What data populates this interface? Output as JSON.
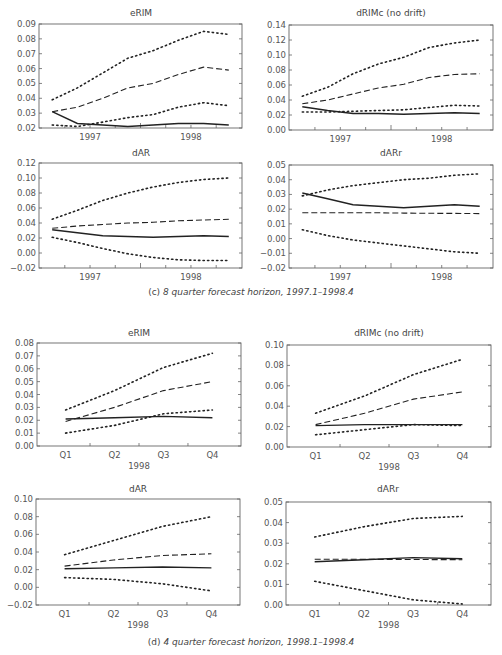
{
  "figure": {
    "caption_c": {
      "label": "(c)",
      "text": "8 quarter forecast horizon, 1997.1–1998.4"
    },
    "caption_d": {
      "label": "(d)",
      "text": "4 quarter forecast horizon, 1998.1–1998.4"
    }
  },
  "chart_data": [
    {
      "id": "c-eRIM",
      "panel": "c",
      "type": "line",
      "title": "eRIM",
      "x": [
        1,
        2,
        3,
        4,
        5,
        6,
        7,
        8
      ],
      "xticks": [
        {
          "pos": 2.5,
          "label": "1997"
        },
        {
          "pos": 6.5,
          "label": "1998"
        }
      ],
      "xlabel": "",
      "ylabel": "",
      "ylim": [
        0.02,
        0.09
      ],
      "yticks": [
        "0.02",
        "0.03",
        "0.04",
        "0.05",
        "0.06",
        "0.07",
        "0.08",
        "0.09"
      ],
      "series": [
        {
          "name": "actual",
          "style": "solid",
          "values": [
            0.031,
            0.023,
            0.022,
            0.021,
            0.022,
            0.023,
            0.023,
            0.022
          ]
        },
        {
          "name": "forecast",
          "style": "dashed",
          "values": [
            0.031,
            0.034,
            0.04,
            0.047,
            0.05,
            0.056,
            0.061,
            0.059
          ]
        },
        {
          "name": "upper band",
          "style": "dotted",
          "values": [
            0.039,
            0.047,
            0.057,
            0.067,
            0.072,
            0.079,
            0.085,
            0.083
          ]
        },
        {
          "name": "lower band",
          "style": "dotted",
          "values": [
            0.022,
            0.021,
            0.024,
            0.027,
            0.029,
            0.034,
            0.037,
            0.035
          ]
        }
      ]
    },
    {
      "id": "c-dRIMc",
      "panel": "c",
      "type": "line",
      "title": "dRIMc (no drift)",
      "x": [
        1,
        2,
        3,
        4,
        5,
        6,
        7,
        8
      ],
      "xticks": [
        {
          "pos": 2.5,
          "label": "1997"
        },
        {
          "pos": 6.5,
          "label": "1998"
        }
      ],
      "xlabel": "",
      "ylabel": "",
      "ylim": [
        0.0,
        0.14
      ],
      "yticks": [
        "0.00",
        "0.02",
        "0.04",
        "0.06",
        "0.08",
        "0.10",
        "0.12",
        "0.14"
      ],
      "series": [
        {
          "name": "actual",
          "style": "solid",
          "values": [
            0.031,
            0.026,
            0.022,
            0.022,
            0.021,
            0.022,
            0.023,
            0.022
          ]
        },
        {
          "name": "forecast",
          "style": "dashed",
          "values": [
            0.035,
            0.04,
            0.048,
            0.056,
            0.061,
            0.07,
            0.074,
            0.075
          ]
        },
        {
          "name": "upper band",
          "style": "dotted",
          "values": [
            0.045,
            0.057,
            0.075,
            0.088,
            0.097,
            0.11,
            0.116,
            0.12
          ]
        },
        {
          "name": "lower band",
          "style": "dotted",
          "values": [
            0.024,
            0.024,
            0.025,
            0.026,
            0.027,
            0.03,
            0.033,
            0.032
          ]
        }
      ]
    },
    {
      "id": "c-dAR",
      "panel": "c",
      "type": "line",
      "title": "dAR",
      "x": [
        1,
        2,
        3,
        4,
        5,
        6,
        7,
        8
      ],
      "xticks": [
        {
          "pos": 2.5,
          "label": "1997"
        },
        {
          "pos": 6.5,
          "label": "1998"
        }
      ],
      "xlabel": "",
      "ylabel": "",
      "ylim": [
        -0.02,
        0.12
      ],
      "yticks": [
        "−0.02",
        "0.00",
        "0.02",
        "0.04",
        "0.06",
        "0.08",
        "0.10",
        "0.12"
      ],
      "series": [
        {
          "name": "actual",
          "style": "solid",
          "values": [
            0.031,
            0.027,
            0.023,
            0.022,
            0.021,
            0.022,
            0.023,
            0.022
          ]
        },
        {
          "name": "forecast",
          "style": "dashed",
          "values": [
            0.033,
            0.036,
            0.038,
            0.04,
            0.041,
            0.043,
            0.044,
            0.045
          ]
        },
        {
          "name": "upper band",
          "style": "dotted",
          "values": [
            0.045,
            0.057,
            0.07,
            0.08,
            0.088,
            0.094,
            0.098,
            0.1
          ]
        },
        {
          "name": "lower band",
          "style": "dotted",
          "values": [
            0.021,
            0.014,
            0.006,
            -0.001,
            -0.006,
            -0.009,
            -0.01,
            -0.01
          ]
        }
      ]
    },
    {
      "id": "c-dARr",
      "panel": "c",
      "type": "line",
      "title": "dARr",
      "x": [
        1,
        2,
        3,
        4,
        5,
        6,
        7,
        8
      ],
      "xticks": [
        {
          "pos": 2.5,
          "label": "1997"
        },
        {
          "pos": 6.5,
          "label": "1998"
        }
      ],
      "xlabel": "",
      "ylabel": "",
      "ylim": [
        -0.02,
        0.05
      ],
      "yticks": [
        "−0.02",
        "−0.01",
        "0.00",
        "0.01",
        "0.02",
        "0.03",
        "0.04",
        "0.05"
      ],
      "series": [
        {
          "name": "actual",
          "style": "solid",
          "values": [
            0.031,
            0.027,
            0.023,
            0.022,
            0.021,
            0.022,
            0.023,
            0.022
          ]
        },
        {
          "name": "forecast",
          "style": "dashed",
          "values": [
            0.0175,
            0.0175,
            0.0175,
            0.0175,
            0.0173,
            0.0172,
            0.0171,
            0.017
          ]
        },
        {
          "name": "upper band",
          "style": "dotted",
          "values": [
            0.029,
            0.033,
            0.036,
            0.038,
            0.04,
            0.041,
            0.043,
            0.044
          ]
        },
        {
          "name": "lower band",
          "style": "dotted",
          "values": [
            0.006,
            0.002,
            -0.001,
            -0.003,
            -0.005,
            -0.007,
            -0.009,
            -0.01
          ]
        }
      ]
    },
    {
      "id": "d-eRIM",
      "panel": "d",
      "type": "line",
      "title": "eRIM",
      "categories": [
        "Q1",
        "Q2",
        "Q3",
        "Q4"
      ],
      "xlabel": "1998",
      "ylabel": "",
      "ylim": [
        0.0,
        0.08
      ],
      "yticks": [
        "0.00",
        "0.01",
        "0.02",
        "0.03",
        "0.04",
        "0.05",
        "0.06",
        "0.07",
        "0.08"
      ],
      "series": [
        {
          "name": "actual",
          "style": "solid",
          "values": [
            0.021,
            0.022,
            0.023,
            0.022
          ]
        },
        {
          "name": "forecast",
          "style": "dashed",
          "values": [
            0.019,
            0.03,
            0.043,
            0.05
          ]
        },
        {
          "name": "upper band",
          "style": "dotted",
          "values": [
            0.028,
            0.043,
            0.061,
            0.072
          ]
        },
        {
          "name": "lower band",
          "style": "dotted",
          "values": [
            0.01,
            0.016,
            0.025,
            0.028
          ]
        }
      ]
    },
    {
      "id": "d-dRIMc",
      "panel": "d",
      "type": "line",
      "title": "dRIMc (no drift)",
      "categories": [
        "Q1",
        "Q2",
        "Q3",
        "Q4"
      ],
      "xlabel": "1998",
      "ylabel": "",
      "ylim": [
        0.0,
        0.1
      ],
      "yticks": [
        "0.00",
        "0.02",
        "0.04",
        "0.06",
        "0.08",
        "0.10"
      ],
      "series": [
        {
          "name": "actual",
          "style": "solid",
          "values": [
            0.021,
            0.022,
            0.022,
            0.022
          ]
        },
        {
          "name": "forecast",
          "style": "dashed",
          "values": [
            0.022,
            0.033,
            0.047,
            0.054
          ]
        },
        {
          "name": "upper band",
          "style": "dotted",
          "values": [
            0.033,
            0.05,
            0.071,
            0.086
          ]
        },
        {
          "name": "lower band",
          "style": "dotted",
          "values": [
            0.012,
            0.017,
            0.022,
            0.021
          ]
        }
      ]
    },
    {
      "id": "d-dAR",
      "panel": "d",
      "type": "line",
      "title": "dAR",
      "categories": [
        "Q1",
        "Q2",
        "Q3",
        "Q4"
      ],
      "xlabel": "1998",
      "ylabel": "",
      "ylim": [
        -0.02,
        0.1
      ],
      "yticks": [
        "−0.02",
        "0.00",
        "0.02",
        "0.04",
        "0.06",
        "0.08",
        "0.10"
      ],
      "series": [
        {
          "name": "actual",
          "style": "solid",
          "values": [
            0.021,
            0.022,
            0.023,
            0.022
          ]
        },
        {
          "name": "forecast",
          "style": "dashed",
          "values": [
            0.024,
            0.031,
            0.036,
            0.038
          ]
        },
        {
          "name": "upper band",
          "style": "dotted",
          "values": [
            0.037,
            0.053,
            0.069,
            0.08
          ]
        },
        {
          "name": "lower band",
          "style": "dotted",
          "values": [
            0.011,
            0.009,
            0.004,
            -0.004
          ]
        }
      ]
    },
    {
      "id": "d-dARr",
      "panel": "d",
      "type": "line",
      "title": "dARr",
      "categories": [
        "Q1",
        "Q2",
        "Q3",
        "Q4"
      ],
      "xlabel": "1998",
      "ylabel": "",
      "ylim": [
        0.0,
        0.05
      ],
      "yticks": [
        "0.00",
        "0.01",
        "0.02",
        "0.03",
        "0.04",
        "0.05"
      ],
      "series": [
        {
          "name": "actual",
          "style": "solid",
          "values": [
            0.021,
            0.022,
            0.023,
            0.0225
          ]
        },
        {
          "name": "forecast",
          "style": "dashed",
          "values": [
            0.0222,
            0.0222,
            0.0221,
            0.022
          ]
        },
        {
          "name": "upper band",
          "style": "dotted",
          "values": [
            0.033,
            0.038,
            0.042,
            0.043
          ]
        },
        {
          "name": "lower band",
          "style": "dotted",
          "values": [
            0.0115,
            0.007,
            0.0025,
            0.0005
          ]
        }
      ]
    }
  ]
}
